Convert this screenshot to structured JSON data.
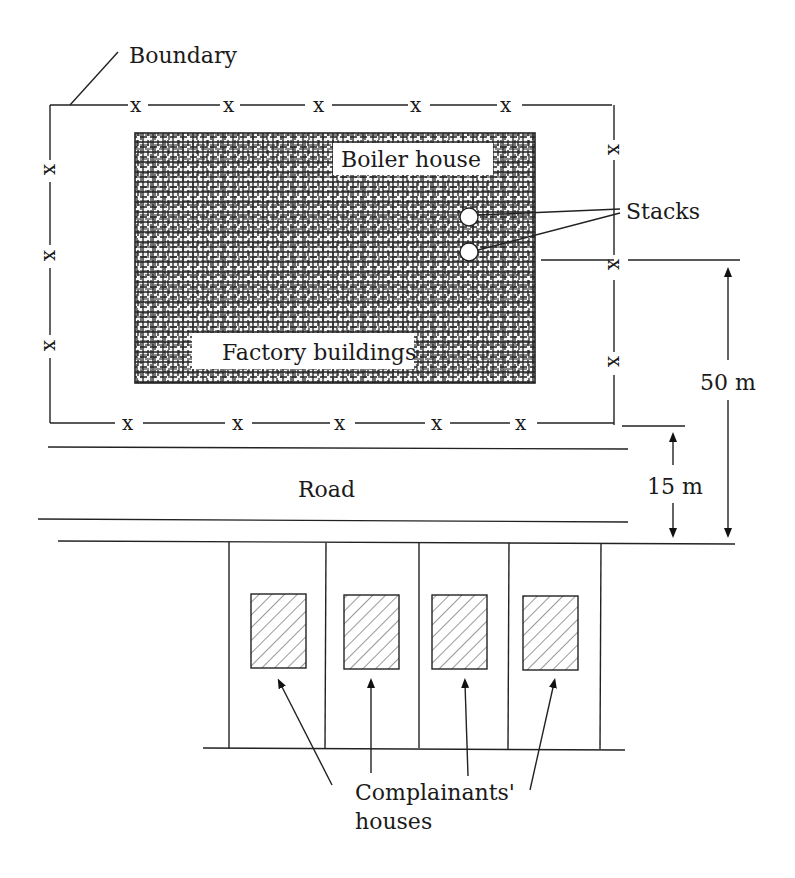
{
  "labels": {
    "boundary": "Boundary",
    "boiler_house": "Boiler house",
    "stacks": "Stacks",
    "factory_buildings": "Factory buildings",
    "road": "Road",
    "distance_50": "50 m",
    "distance_15": "15 m",
    "complainants_line1": "Complainants'",
    "complainants_line2": "houses"
  },
  "fence_marker": "x",
  "colors": {
    "ink": "#222222",
    "background": "#ffffff"
  },
  "houses": [
    {
      "id": 1
    },
    {
      "id": 2
    },
    {
      "id": 3
    },
    {
      "id": 4
    }
  ]
}
